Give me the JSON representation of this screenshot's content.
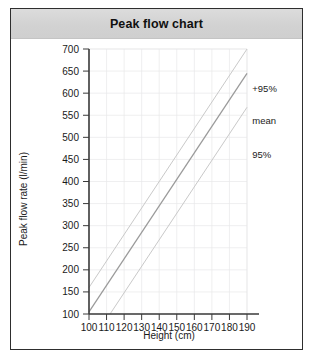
{
  "card": {
    "title": "Peak flow chart",
    "border_color": "#2e2e2e",
    "header_bg": "#d4d4d4",
    "body_bg": "#ffffff"
  },
  "chart_data": {
    "type": "line",
    "title": "Peak flow chart",
    "xlabel": "Height (cm)",
    "ylabel": "Peak flow rate (l/min)",
    "xlim": [
      100,
      190
    ],
    "ylim": [
      100,
      700
    ],
    "xticks": [
      100,
      110,
      120,
      130,
      140,
      150,
      160,
      170,
      180,
      190
    ],
    "yticks": [
      100,
      150,
      200,
      250,
      300,
      350,
      400,
      450,
      500,
      550,
      600,
      650,
      700
    ],
    "grid": true,
    "legend_position": "right-inline",
    "series": [
      {
        "name": "+95%",
        "label": "+95%",
        "color": "#c9c9c9",
        "x": [
          100,
          190
        ],
        "values": [
          160,
          700
        ]
      },
      {
        "name": "mean",
        "label": "mean",
        "color": "#9a9a9a",
        "x": [
          100,
          190
        ],
        "values": [
          105,
          645
        ]
      },
      {
        "name": "95%",
        "label": "95%",
        "color": "#c9c9c9",
        "x": [
          112,
          190
        ],
        "values": [
          100,
          568
        ]
      }
    ],
    "annotations": [
      {
        "text": "+95%",
        "x": 193,
        "y": 610
      },
      {
        "text": "mean",
        "x": 193,
        "y": 538
      },
      {
        "text": "95%",
        "x": 193,
        "y": 462
      }
    ]
  }
}
